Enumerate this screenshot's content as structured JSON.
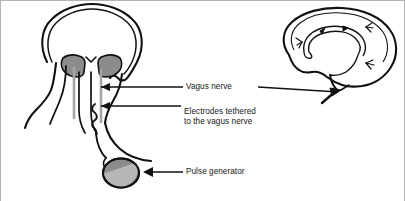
{
  "figure": {
    "width": 405,
    "height": 201,
    "background_color": "#ffffff",
    "border_color": "#b4b4b4",
    "ink_color": "#111111",
    "shade_color": "#8c8c8c",
    "lead_color": "#a5a5a5"
  },
  "annotations": {
    "vagus_nerve": {
      "label": "Vagus nerve",
      "arrow": "left-pointing"
    },
    "electrodes": {
      "label_line1": "Electrodes tethered",
      "label_line2": "to the vagus nerve",
      "arrow": "left-pointing"
    },
    "pulse_generator": {
      "label": "Pulse generator",
      "arrow": "left-pointing"
    }
  },
  "anatomy": {
    "head_coronal": {
      "name": "head-and-neck-coronal-view",
      "structures": [
        "skull-outline",
        "left-temporal-lobe-shaded",
        "right-temporal-lobe-shaded",
        "neck-outline",
        "trachea",
        "electrode-lead-left",
        "electrode-lead-right",
        "coiled-nerve-wire"
      ]
    },
    "brain_sagittal": {
      "name": "brain-sagittal-view",
      "structures": [
        "cerebral-cortex-outline",
        "corpus-callosum",
        "lateral-ventricle",
        "brainstem",
        "cranial-nerve-branches",
        "signal-direction-arrowheads"
      ]
    },
    "device": {
      "name": "pulse-generator-implant",
      "shape": "ellipse",
      "fill": "#8c8c8c",
      "highlight": "#b9b9b9"
    }
  }
}
